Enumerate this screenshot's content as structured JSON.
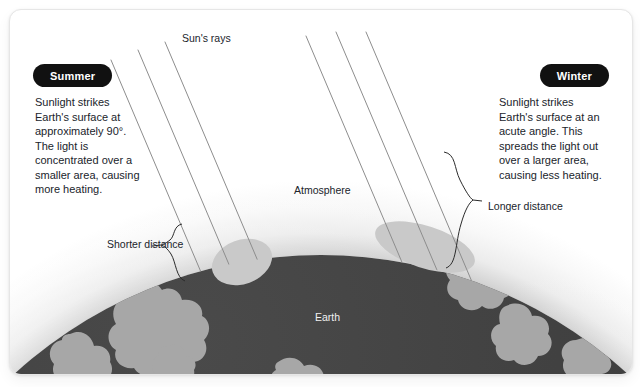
{
  "diagram": {
    "title_labels": {
      "sun_rays": "Sun's rays",
      "atmosphere": "Atmosphere",
      "earth": "Earth"
    },
    "summer": {
      "pill_label": "Summer",
      "body": "Sunlight strikes Earth's surface at approximately 90°. The light is concentrated over a smaller area, causing more heating.",
      "distance_label": "Shorter distance"
    },
    "winter": {
      "pill_label": "Winter",
      "body": "Sunlight strikes Earth's surface at an acute angle. This spreads the light out over a larger area, causing less heating.",
      "distance_label": "Longer distance"
    },
    "colors": {
      "card_background": "#ffffff",
      "card_border": "#e6e6e6",
      "pill_background": "#111111",
      "pill_text": "#ffffff",
      "body_text": "#20242b",
      "earth_body": "#3b3b3b",
      "earth_land": "#a8a8a8",
      "sunlight_patch": "#c9c9c9",
      "ray_stroke": "#8a8a8a",
      "brace_stroke": "#2b2b2b",
      "atmosphere_outer": "#f7f7f7",
      "atmosphere_inner": "#c6c6c6"
    },
    "geometry": {
      "earth_center_x": 311,
      "earth_center_y": 700,
      "earth_radius": 455,
      "atmosphere_radius": 530,
      "ray_angle_deg_from_vertical": 23,
      "summer_ray_count": 3,
      "winter_ray_count": 3
    }
  }
}
